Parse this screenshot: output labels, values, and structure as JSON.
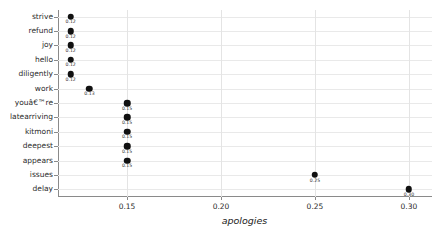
{
  "chart_data": {
    "type": "scatter",
    "title": "",
    "subtitle": "",
    "xlabel": "apologies",
    "ylabel": "",
    "xlim": [
      0.113,
      0.312
    ],
    "xticks": [
      0.15,
      0.2,
      0.25,
      0.3
    ],
    "xtick_labels": [
      "0.15",
      "0.20",
      "0.25",
      "0.30"
    ],
    "grid": true,
    "legend": false,
    "legend_position": "none",
    "categories": [
      "strive",
      "refund",
      "joy",
      "hello",
      "diligently",
      "work",
      "youâ€™re",
      "latearriving",
      "kitmoni",
      "deepest",
      "appears",
      "issues",
      "delay"
    ],
    "values": [
      0.12,
      0.12,
      0.12,
      0.12,
      0.12,
      0.13,
      0.15,
      0.15,
      0.15,
      0.15,
      0.15,
      0.25,
      0.3
    ],
    "point_labels": [
      "0.12",
      "0.12",
      "0.12",
      "0.12",
      "0.12",
      "0.13",
      "0.15",
      "0.15",
      "0.15",
      "0.15",
      "0.15",
      "0.25",
      "0.30"
    ],
    "marker_color": "#111111",
    "grid_color": "#e9e9e9",
    "axis_color": "#8a8a8a",
    "background_color": "#ffffff"
  }
}
